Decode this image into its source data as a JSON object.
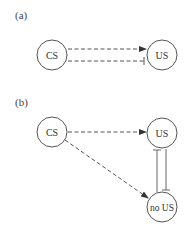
{
  "panels": [
    {
      "label": "(a)",
      "nodes": {
        "cs": "CS",
        "us": "US"
      },
      "edges": [
        {
          "from": "CS",
          "to": "US",
          "style": "dashed",
          "head": "arrow"
        },
        {
          "from": "CS",
          "to": "US",
          "style": "dashed",
          "head": "inhibit"
        }
      ]
    },
    {
      "label": "(b)",
      "nodes": {
        "cs": "CS",
        "us": "US",
        "nous": "no US"
      },
      "edges": [
        {
          "from": "CS",
          "to": "US",
          "style": "dashed",
          "head": "arrow"
        },
        {
          "from": "CS",
          "to": "no US",
          "style": "dashed",
          "head": "arrow"
        },
        {
          "from": "no US",
          "to": "US",
          "style": "solid",
          "head": "inhibit"
        },
        {
          "from": "US",
          "to": "no US",
          "style": "solid",
          "head": "inhibit"
        }
      ]
    }
  ],
  "colors": {
    "stroke": "#555555",
    "text": "#333333"
  }
}
